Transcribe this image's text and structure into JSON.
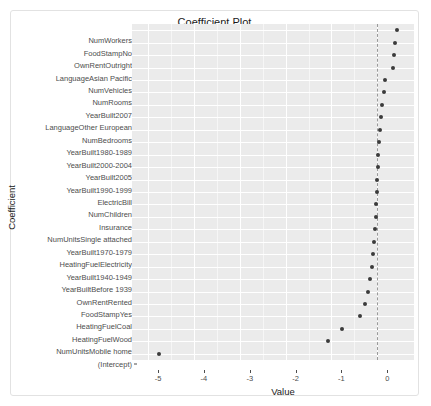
{
  "chart_data": {
    "type": "scatter",
    "title": "Coefficient Plot",
    "xlabel": "Value",
    "ylabel": "Coefficient",
    "xlim": [
      -5.35,
      0.8
    ],
    "xticks": [
      -5,
      -4,
      -3,
      -2,
      -1,
      0
    ],
    "xticklabels": [
      "-5",
      "-4",
      "-3",
      "-2",
      "-1",
      "0"
    ],
    "grid": true,
    "legend": false,
    "reference_line": {
      "x": 0,
      "style": "dashed",
      "color": "#9a9a9a"
    },
    "point_color": "#3b3b3b",
    "panel_background": "#ebebeb",
    "categories": [
      "NumWorkers",
      "FoodStampNo",
      "OwnRentOutright",
      "LanguageAsian Pacific",
      "NumVehicles",
      "NumRooms",
      "YearBuilt2007",
      "LanguageOther European",
      "NumBedrooms",
      "YearBuilt1980-1989",
      "YearBuilt2000-2004",
      "YearBuilt2005",
      "YearBuilt1990-1999",
      "ElectricBill",
      "NumChildren",
      "Insurance",
      "NumUnitsSingle attached",
      "YearBuilt1970-1979",
      "HeatingFuelElectricity",
      "YearBuilt1940-1949",
      "YearBuiltBefore 1939",
      "OwnRentRented",
      "FoodStampYes",
      "HeatingFuelCoal",
      "HeatingFuelWood",
      "NumUnitsMobile home",
      "(Intercept)"
    ],
    "values": [
      0.44,
      0.38,
      0.36,
      0.34,
      0.16,
      0.14,
      0.11,
      0.09,
      0.06,
      0.04,
      0.02,
      0.01,
      0.0,
      -0.01,
      -0.02,
      -0.03,
      -0.05,
      -0.07,
      -0.09,
      -0.12,
      -0.16,
      -0.21,
      -0.27,
      -0.37,
      -0.77,
      -1.07,
      -4.76
    ]
  }
}
